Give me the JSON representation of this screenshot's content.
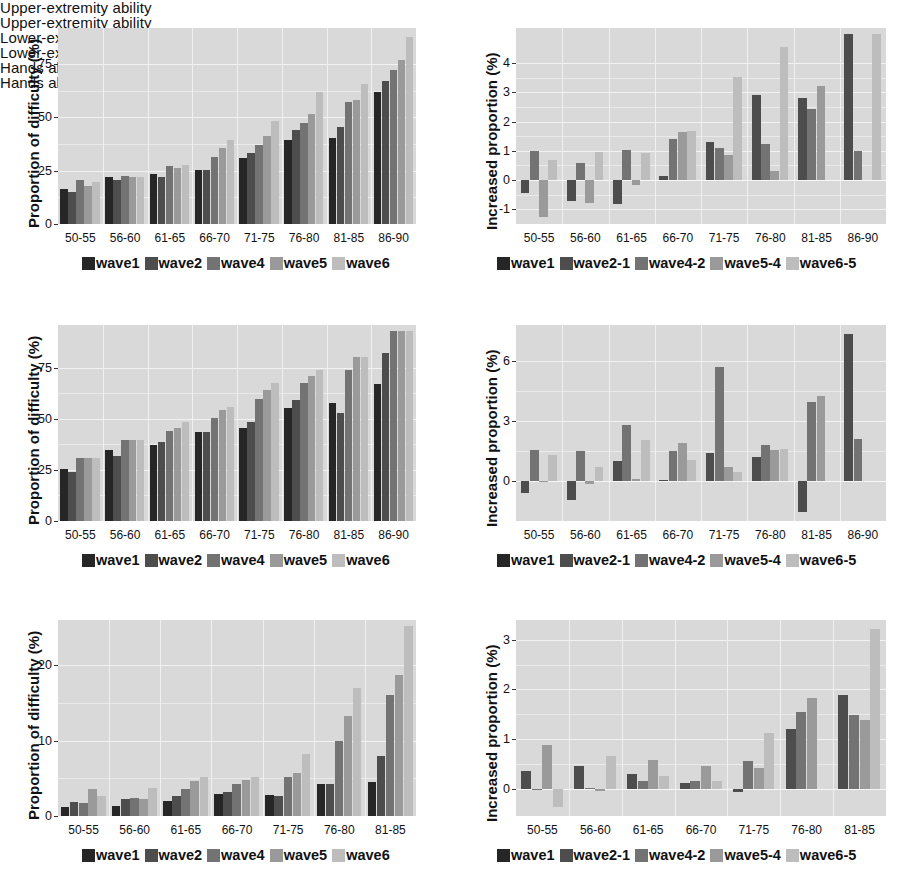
{
  "figure": {
    "background": "#ffffff",
    "plot_background": "#d9d9d9",
    "palette": [
      "#262626",
      "#4d4d4d",
      "#737373",
      "#9a9a9a",
      "#bdbdbd"
    ]
  },
  "legends": {
    "left": [
      "wave1",
      "wave2",
      "wave4",
      "wave5",
      "wave6"
    ],
    "right": [
      "wave1",
      "wave2-1",
      "wave4-2",
      "wave5-4",
      "wave6-5"
    ]
  },
  "axis_titles": {
    "left": "Proportion of difficulty (%)",
    "right": "Increased proportion (%)"
  },
  "chart_data": [
    {
      "id": "upper-extremity-proportion",
      "type": "bar",
      "title": "Upper-extremity ability",
      "xlabel": "",
      "ylabel": "Proportion of difficulty (%)",
      "ylim": [
        0,
        92
      ],
      "yticks": [
        0,
        25,
        50,
        75
      ],
      "grid": true,
      "legend_position": "bottom",
      "categories": [
        "50-55",
        "56-60",
        "61-65",
        "66-70",
        "71-75",
        "76-80",
        "81-85",
        "86-90"
      ],
      "series": [
        {
          "name": "wave1",
          "color": "#262626",
          "values": [
            16.5,
            22.0,
            23.5,
            25.5,
            31.0,
            39.5,
            40.5,
            62.0
          ]
        },
        {
          "name": "wave2",
          "color": "#4d4d4d",
          "values": [
            15.0,
            20.5,
            22.0,
            25.5,
            33.5,
            44.0,
            45.5,
            67.0
          ]
        },
        {
          "name": "wave4",
          "color": "#737373",
          "values": [
            20.5,
            22.5,
            27.0,
            31.5,
            37.0,
            47.5,
            57.5,
            72.5
          ]
        },
        {
          "name": "wave5",
          "color": "#9a9a9a",
          "values": [
            18.0,
            22.0,
            26.5,
            35.5,
            41.5,
            51.5,
            58.0,
            77.0
          ]
        },
        {
          "name": "wave6",
          "color": "#bdbdbd",
          "values": [
            19.5,
            22.0,
            27.5,
            39.5,
            48.5,
            62.0,
            65.5,
            88.0
          ]
        }
      ]
    },
    {
      "id": "upper-extremity-increase",
      "type": "bar",
      "title": "Upper-extremity ability",
      "xlabel": "",
      "ylabel": "Increased proportion (%)",
      "ylim": [
        -1.5,
        5.2
      ],
      "yticks": [
        -1,
        0,
        1,
        2,
        3,
        4
      ],
      "grid": true,
      "legend_position": "bottom",
      "categories": [
        "50-55",
        "56-60",
        "61-65",
        "66-70",
        "71-75",
        "76-80",
        "81-85",
        "86-90"
      ],
      "series": [
        {
          "name": "wave2-1",
          "color": "#4d4d4d",
          "values": [
            -0.45,
            -0.7,
            -0.8,
            0.15,
            1.3,
            2.9,
            2.8,
            5.0
          ]
        },
        {
          "name": "wave4-2",
          "color": "#737373",
          "values": [
            1.0,
            0.58,
            1.02,
            1.4,
            1.1,
            1.25,
            2.42,
            0.98
          ]
        },
        {
          "name": "wave5-4",
          "color": "#9a9a9a",
          "values": [
            -1.25,
            -0.78,
            -0.18,
            1.65,
            0.85,
            0.32,
            3.22,
            0.0
          ]
        },
        {
          "name": "wave6-5",
          "color": "#bdbdbd",
          "values": [
            0.68,
            0.95,
            0.92,
            1.68,
            3.52,
            4.55,
            0.0,
            5.0
          ]
        }
      ]
    },
    {
      "id": "lower-extremity-proportion",
      "type": "bar",
      "title": "Lower-extremity ability",
      "xlabel": "",
      "ylabel": "Proportion of difficulty (%)",
      "ylim": [
        0,
        96
      ],
      "yticks": [
        0,
        25,
        50,
        75
      ],
      "grid": true,
      "legend_position": "bottom",
      "categories": [
        "50-55",
        "56-60",
        "61-65",
        "66-70",
        "71-75",
        "76-80",
        "81-85",
        "86-90"
      ],
      "series": [
        {
          "name": "wave1",
          "color": "#262626",
          "values": [
            25.5,
            35.0,
            37.0,
            43.5,
            45.5,
            55.5,
            58.0,
            67.0
          ]
        },
        {
          "name": "wave2",
          "color": "#4d4d4d",
          "values": [
            24.0,
            32.0,
            38.5,
            43.5,
            48.5,
            59.5,
            53.0,
            82.5
          ]
        },
        {
          "name": "wave4",
          "color": "#737373",
          "values": [
            31.0,
            39.5,
            44.0,
            50.5,
            60.0,
            67.5,
            74.0,
            93.0
          ]
        },
        {
          "name": "wave5",
          "color": "#9a9a9a",
          "values": [
            31.0,
            39.5,
            45.5,
            54.5,
            64.0,
            71.0,
            80.5,
            93.0
          ]
        },
        {
          "name": "wave6",
          "color": "#bdbdbd",
          "values": [
            31.0,
            39.5,
            48.5,
            56.0,
            67.5,
            74.0,
            80.5,
            93.0
          ]
        }
      ]
    },
    {
      "id": "lower-extremity-increase",
      "type": "bar",
      "title": "Lower-extremity ability",
      "xlabel": "",
      "ylabel": "Increased proportion (%)",
      "ylim": [
        -2.0,
        7.8
      ],
      "yticks": [
        0,
        3,
        6
      ],
      "grid": true,
      "legend_position": "bottom",
      "categories": [
        "50-55",
        "56-60",
        "61-65",
        "66-70",
        "71-75",
        "76-80",
        "81-85",
        "86-90"
      ],
      "series": [
        {
          "name": "wave2-1",
          "color": "#4d4d4d",
          "values": [
            -0.62,
            -0.95,
            1.02,
            0.05,
            1.38,
            1.18,
            -1.55,
            7.35
          ]
        },
        {
          "name": "wave4-2",
          "color": "#737373",
          "values": [
            1.55,
            1.5,
            2.82,
            1.52,
            5.7,
            1.82,
            3.95,
            2.1
          ]
        },
        {
          "name": "wave5-4",
          "color": "#9a9a9a",
          "values": [
            0.02,
            -0.15,
            0.1,
            1.92,
            0.7,
            1.55,
            4.25,
            0.0
          ]
        },
        {
          "name": "wave6-5",
          "color": "#bdbdbd",
          "values": [
            1.28,
            0.72,
            2.05,
            1.05,
            0.45,
            1.6,
            0.0,
            0.0
          ]
        }
      ]
    },
    {
      "id": "hands-proportion",
      "type": "bar",
      "title": "Hands ability",
      "xlabel": "",
      "ylabel": "Proportion of difficulty (%)",
      "ylim": [
        0,
        26
      ],
      "yticks": [
        0,
        10,
        20
      ],
      "grid": true,
      "legend_position": "bottom",
      "categories": [
        "50-55",
        "56-60",
        "61-65",
        "66-70",
        "71-75",
        "76-80",
        "81-85"
      ],
      "series": [
        {
          "name": "wave1",
          "color": "#262626",
          "values": [
            1.2,
            1.3,
            2.0,
            2.9,
            2.8,
            4.2,
            4.5
          ]
        },
        {
          "name": "wave2",
          "color": "#4d4d4d",
          "values": [
            1.9,
            2.3,
            2.6,
            3.2,
            2.6,
            4.2,
            8.0
          ]
        },
        {
          "name": "wave4",
          "color": "#737373",
          "values": [
            1.7,
            2.4,
            3.6,
            4.2,
            5.2,
            10.0,
            16.0
          ]
        },
        {
          "name": "wave5",
          "color": "#9a9a9a",
          "values": [
            3.6,
            2.3,
            4.6,
            4.8,
            5.7,
            13.2,
            18.7
          ]
        },
        {
          "name": "wave6",
          "color": "#bdbdbd",
          "values": [
            2.6,
            3.7,
            5.2,
            5.2,
            8.2,
            17.0,
            25.2
          ]
        }
      ]
    },
    {
      "id": "hands-increase",
      "type": "bar",
      "title": "Hands ability",
      "xlabel": "",
      "ylabel": "Increased proportion (%)",
      "ylim": [
        -0.55,
        3.4
      ],
      "yticks": [
        0,
        1,
        2,
        3
      ],
      "grid": true,
      "legend_position": "bottom",
      "categories": [
        "50-55",
        "56-60",
        "61-65",
        "66-70",
        "71-75",
        "76-80",
        "81-85"
      ],
      "series": [
        {
          "name": "wave2-1",
          "color": "#4d4d4d",
          "values": [
            0.35,
            0.45,
            0.29,
            0.12,
            -0.06,
            1.2,
            1.88
          ]
        },
        {
          "name": "wave4-2",
          "color": "#737373",
          "values": [
            -0.03,
            0.02,
            0.16,
            0.16,
            0.55,
            1.55,
            1.48
          ]
        },
        {
          "name": "wave5-4",
          "color": "#9a9a9a",
          "values": [
            0.88,
            -0.04,
            0.57,
            0.46,
            0.42,
            1.82,
            1.38
          ]
        },
        {
          "name": "wave6-5",
          "color": "#bdbdbd",
          "values": [
            -0.36,
            0.66,
            0.25,
            0.16,
            1.12,
            0.0,
            3.22
          ]
        }
      ]
    }
  ]
}
